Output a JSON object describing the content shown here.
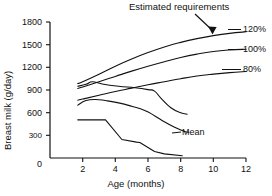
{
  "chart_data": {
    "type": "line",
    "title": "",
    "xlabel": "Age (months)",
    "ylabel": "Breast milk (g/day)",
    "xlim": [
      0,
      12
    ],
    "ylim": [
      0,
      1800
    ],
    "xticks": [
      0,
      2,
      4,
      6,
      8,
      10,
      12
    ],
    "yticks": [
      0,
      300,
      600,
      900,
      1200,
      1500,
      1800
    ],
    "xtick_labels": [
      "0",
      "2",
      "4",
      "6",
      "8",
      "10",
      "12"
    ],
    "ytick_labels": [
      "0",
      "300",
      "600",
      "900",
      "1200",
      "1500",
      "1800"
    ],
    "grid": false,
    "legend_position": "right-inline-labels",
    "annotations": [
      {
        "name": "estimated-requirements",
        "text": "Estimated requirements",
        "points_to_series": "120%",
        "arrow_target_x": 10.6,
        "arrow_target_y": 1610
      },
      {
        "name": "mean",
        "text": "Mean",
        "points_to_series": "Mean"
      }
    ],
    "series": [
      {
        "name": "120%",
        "label": "120%",
        "kind": "estimated-requirement",
        "x": [
          1.7,
          2,
          3,
          4,
          5,
          6,
          7,
          8,
          9,
          10,
          11,
          12
        ],
        "y": [
          985,
          1010,
          1110,
          1215,
          1310,
          1395,
          1470,
          1530,
          1580,
          1620,
          1650,
          1670
        ]
      },
      {
        "name": "100%",
        "label": "100%",
        "kind": "estimated-requirement",
        "x": [
          1.7,
          2,
          3,
          4,
          5,
          6,
          7,
          8,
          9,
          10,
          11,
          12
        ],
        "y": [
          920,
          940,
          1010,
          1080,
          1150,
          1215,
          1275,
          1330,
          1375,
          1410,
          1430,
          1440
        ]
      },
      {
        "name": "80%",
        "label": "80%",
        "kind": "estimated-requirement",
        "x": [
          1.7,
          2,
          3,
          4,
          5,
          6,
          7,
          8,
          9,
          10,
          11,
          12
        ],
        "y": [
          765,
          780,
          830,
          880,
          925,
          970,
          1010,
          1050,
          1085,
          1110,
          1130,
          1145
        ]
      },
      {
        "name": "upper-intake",
        "label": "",
        "kind": "measured",
        "x": [
          1.7,
          2.2,
          2.6,
          3.2,
          4.2,
          5.2,
          6.0,
          6.4,
          6.8,
          7.4,
          8.0,
          8.4
        ],
        "y": [
          950,
          975,
          1010,
          980,
          950,
          930,
          905,
          885,
          790,
          665,
          600,
          580
        ]
      },
      {
        "name": "Mean",
        "label": "Mean",
        "kind": "measured",
        "x": [
          1.7,
          2.2,
          2.8,
          3.4,
          4.2,
          5.0,
          5.8,
          6.4,
          7.0,
          7.6,
          8.2,
          8.5
        ],
        "y": [
          700,
          760,
          775,
          760,
          730,
          685,
          630,
          560,
          480,
          410,
          355,
          340
        ]
      },
      {
        "name": "lower-intake",
        "label": "",
        "kind": "measured",
        "x": [
          1.7,
          3.4,
          4.4,
          5.3,
          5.5,
          6.4,
          7.0,
          8.1
        ],
        "y": [
          505,
          505,
          245,
          210,
          205,
          85,
          55,
          30
        ]
      }
    ]
  },
  "axes": {
    "y_title": "Breast milk (g/day)",
    "x_title": "Age (months)"
  },
  "labels": {
    "estimated_requirements": "Estimated requirements",
    "mean": "Mean",
    "pct_120": "120%",
    "pct_100": "100%",
    "pct_80": "80%"
  }
}
